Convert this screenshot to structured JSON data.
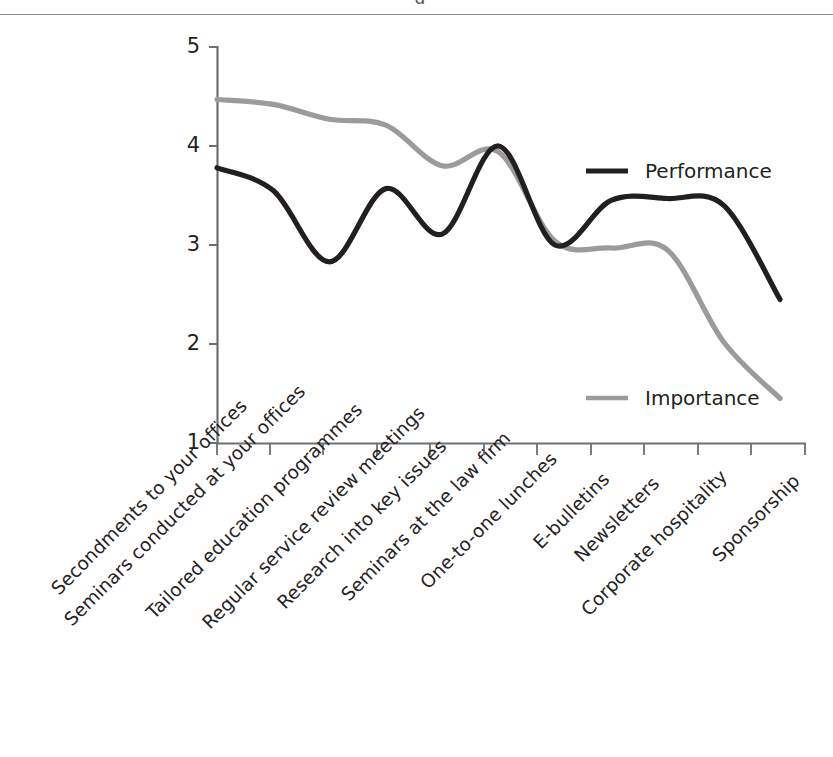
{
  "page": {
    "background": "#ffffff",
    "clipped_header_fragment": "g"
  },
  "chart_data": {
    "type": "line",
    "title": "",
    "xlabel": "",
    "ylabel": "",
    "ylim": [
      1,
      5
    ],
    "yticks": [
      5,
      4,
      3,
      2,
      1
    ],
    "grid": false,
    "legend_position": "right-inside",
    "categories": [
      "Secondments to your offices",
      "Seminars conducted at your offices",
      "Tailored education programmes",
      "Regular service review meetings",
      "Research into key issues",
      "Seminars at the law firm",
      "One-to-one lunches",
      "E-bulletins",
      "Newsletters",
      "Corporate hospitality",
      "Sponsorship"
    ],
    "series": [
      {
        "name": "Performance",
        "color": "#231f20",
        "values": [
          3.78,
          3.55,
          2.83,
          3.57,
          3.11,
          4.0,
          3.0,
          3.45,
          3.47,
          3.4,
          2.45
        ]
      },
      {
        "name": "Importance",
        "color": "#9b9b9b",
        "values": [
          4.47,
          4.42,
          4.27,
          4.21,
          3.8,
          3.94,
          3.04,
          2.97,
          2.95,
          2.02,
          1.45
        ]
      }
    ]
  },
  "axis": {
    "y_tick_labels": [
      "5",
      "4",
      "3",
      "2",
      "1"
    ]
  },
  "legend": {
    "items": [
      {
        "label": "Performance",
        "color": "#231f20"
      },
      {
        "label": "Importance",
        "color": "#9b9b9b"
      }
    ]
  }
}
